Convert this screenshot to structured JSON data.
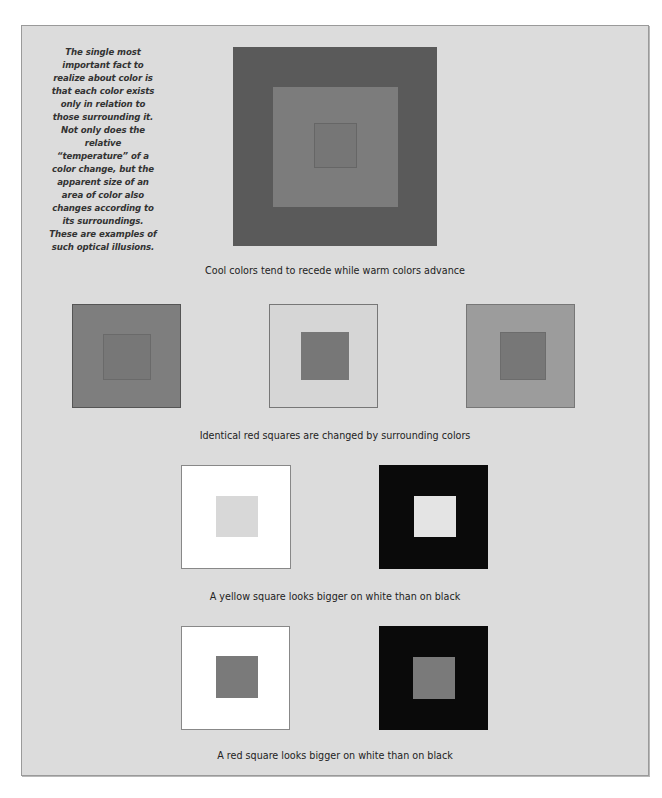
{
  "intro_text": "The single most important fact to realize about color is that each color exists only in relation to those surrounding it. Not only does the relative “temperature” of a color change, but the apparent size of an area of color also changes according to its surroundings. These are examples of such optical illusions.",
  "figures": [
    {
      "caption": "Cool colors tend to recede while warm colors advance",
      "squares": [
        {
          "outer": "#5a5a5a",
          "middle": "#7c7c7c",
          "inner": "#757575"
        }
      ]
    },
    {
      "caption": "Identical red squares are changed by surrounding colors",
      "squares": [
        {
          "outer": "#7e7e7e",
          "inner": "#777777"
        },
        {
          "outer": "#d6d6d6",
          "inner": "#777777"
        },
        {
          "outer": "#9c9c9c",
          "inner": "#777777"
        }
      ]
    },
    {
      "caption": "A yellow square looks bigger on white than on black",
      "squares": [
        {
          "outer": "#ffffff",
          "inner": "#d8d8d8"
        },
        {
          "outer": "#0a0a0a",
          "inner": "#e4e4e4"
        }
      ]
    },
    {
      "caption": "A red square looks bigger on white than on black",
      "squares": [
        {
          "outer": "#ffffff",
          "inner": "#7a7a7a"
        },
        {
          "outer": "#0a0a0a",
          "inner": "#7a7a7a"
        }
      ]
    }
  ],
  "colors": {
    "panel_bg": "#dcdcdc",
    "panel_border": "#9a9a9a"
  }
}
